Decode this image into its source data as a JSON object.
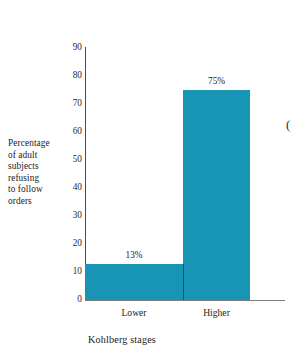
{
  "chart_data": {
    "type": "bar",
    "title": "",
    "subtitle": "",
    "categories": [
      "Lower",
      "Higher"
    ],
    "values": [
      13,
      75
    ],
    "value_labels": [
      "13%",
      "75%"
    ],
    "series": [
      {
        "name": "Percentage of adult subjects refusing to follow orders",
        "values": [
          13,
          75
        ]
      }
    ],
    "xlabel": "Kohlberg stages",
    "ylabel": "Percentage of adult subjects refusing to follow orders",
    "ylabel_lines": [
      "Percentage",
      "of adult",
      "subjects",
      "refusing",
      "to follow",
      "orders"
    ],
    "ylim": [
      0,
      90
    ],
    "yticks": [
      0,
      10,
      20,
      30,
      40,
      50,
      60,
      70,
      80,
      90
    ],
    "ytick_labels": [
      "0",
      "10",
      "20",
      "30",
      "40",
      "50",
      "60",
      "70",
      "80",
      "90"
    ],
    "grid": false,
    "legend": false,
    "legend_position": "none",
    "bar_gap": 0,
    "colors": {
      "bar": "#1895B4",
      "axis": "#4A4A4A",
      "baseline": "#7E7E7E",
      "text": "#1B1B1B",
      "tick_text": "#2A2A2A",
      "background": "#FFFFFF",
      "bar_divider": "#2F4F58"
    }
  },
  "margin": {
    "glyph_fragment": "("
  }
}
